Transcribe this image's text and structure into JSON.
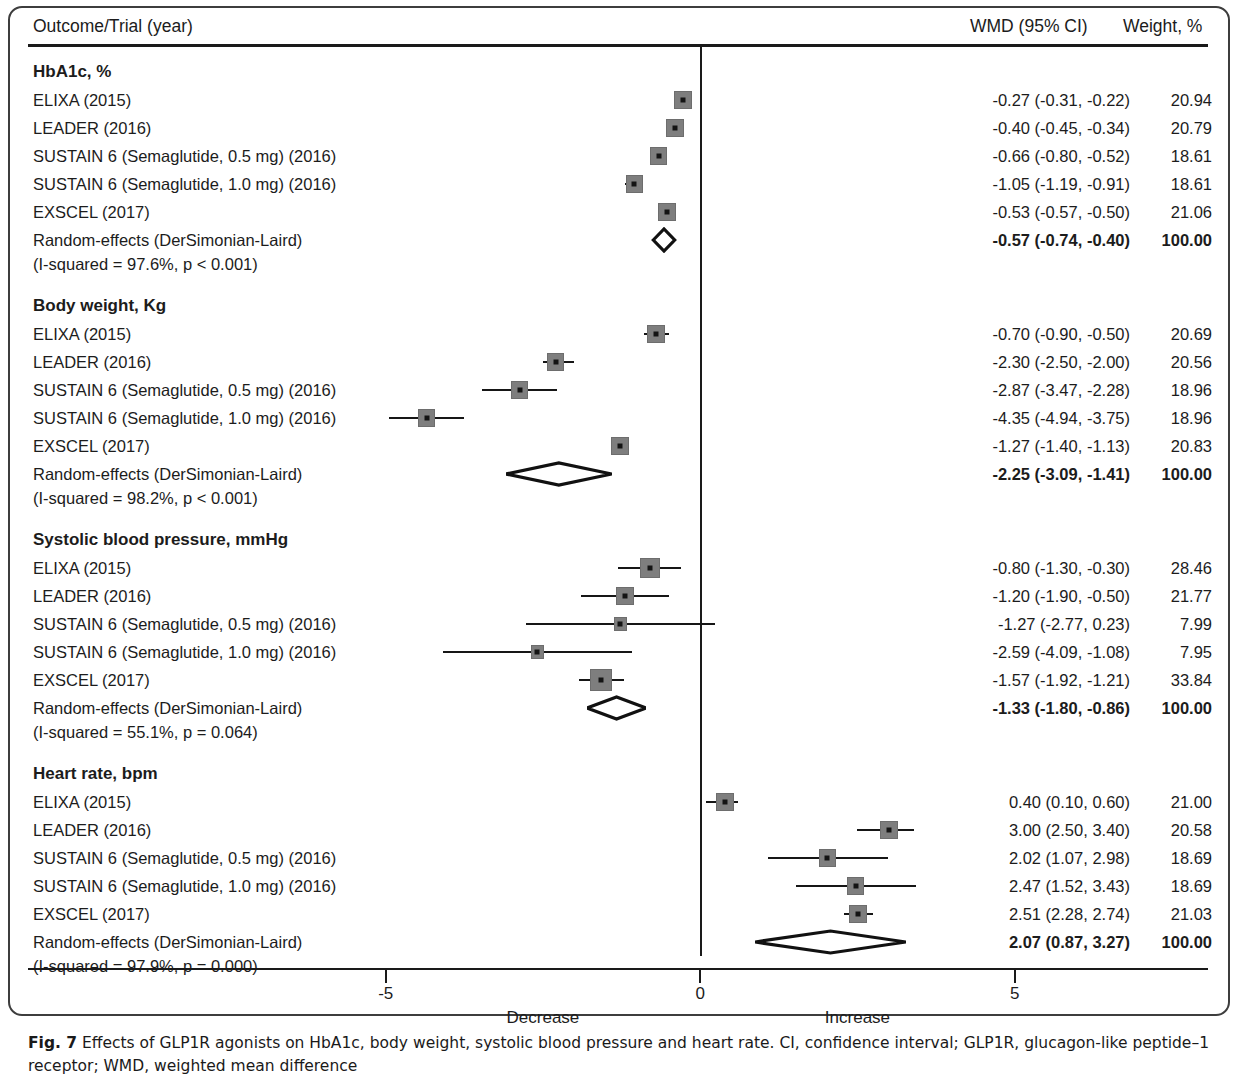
{
  "figure": {
    "caption_prefix": "Fig. 7",
    "caption_text": " Effects of GLP1R agonists on HbA1c, body weight, systolic blood pressure and heart rate. CI, confidence interval; GLP1R, glucagon-like peptide–1 receptor; WMD, weighted mean difference"
  },
  "header": {
    "outcome": "Outcome/Trial (year)",
    "wmd": "WMD (95% CI)",
    "weight": "Weight, %"
  },
  "axis": {
    "ticks": [
      {
        "value": -5,
        "label": "-5"
      },
      {
        "value": 0,
        "label": "0"
      },
      {
        "value": 5,
        "label": "5"
      }
    ],
    "left_direction_label": "Decrease",
    "right_direction_label": "Increase",
    "xmin": -5.95,
    "xmax": 5.95,
    "zero_reference": 0
  },
  "chart_data": {
    "type": "forest",
    "title": "Effects of GLP1R agonists on HbA1c, body weight, systolic blood pressure and heart rate",
    "xlabel": "",
    "ylabel": "",
    "effect_measure": "WMD (95% CI)",
    "xlim": [
      -5.95,
      5.95
    ],
    "xticks": [
      -5,
      0,
      5
    ],
    "grid": false,
    "legend": "none",
    "null_line": 0,
    "groups": [
      {
        "title": "HbA1c, %",
        "heterogeneity": "(I-squared = 97.6%, p < 0.001)",
        "pooled_label": "Random-effects (DerSimonian-Laird)",
        "pooled": {
          "est": -0.57,
          "lo": -0.74,
          "hi": -0.4,
          "text": "-0.57 (-0.74, -0.40)",
          "weight": "100.00"
        },
        "studies": [
          {
            "label": "ELIXA (2015)",
            "est": -0.27,
            "lo": -0.31,
            "hi": -0.22,
            "text": "-0.27 (-0.31, -0.22)",
            "weight": "20.94",
            "weight_num": 20.94
          },
          {
            "label": "LEADER (2016)",
            "est": -0.4,
            "lo": -0.45,
            "hi": -0.34,
            "text": "-0.40 (-0.45, -0.34)",
            "weight": "20.79",
            "weight_num": 20.79
          },
          {
            "label": "SUSTAIN 6 (Semaglutide, 0.5 mg) (2016)",
            "est": -0.66,
            "lo": -0.8,
            "hi": -0.52,
            "text": "-0.66 (-0.80, -0.52)",
            "weight": "18.61",
            "weight_num": 18.61
          },
          {
            "label": "SUSTAIN 6 (Semaglutide, 1.0 mg) (2016)",
            "est": -1.05,
            "lo": -1.19,
            "hi": -0.91,
            "text": "-1.05 (-1.19, -0.91)",
            "weight": "18.61",
            "weight_num": 18.61
          },
          {
            "label": "EXSCEL (2017)",
            "est": -0.53,
            "lo": -0.57,
            "hi": -0.5,
            "text": "-0.53 (-0.57, -0.50)",
            "weight": "21.06",
            "weight_num": 21.06
          }
        ]
      },
      {
        "title": "Body weight, Kg",
        "heterogeneity": "(I-squared = 98.2%, p < 0.001)",
        "pooled_label": "Random-effects (DerSimonian-Laird)",
        "pooled": {
          "est": -2.25,
          "lo": -3.09,
          "hi": -1.41,
          "text": "-2.25 (-3.09, -1.41)",
          "weight": "100.00"
        },
        "studies": [
          {
            "label": "ELIXA (2015)",
            "est": -0.7,
            "lo": -0.9,
            "hi": -0.5,
            "text": "-0.70 (-0.90, -0.50)",
            "weight": "20.69",
            "weight_num": 20.69
          },
          {
            "label": "LEADER (2016)",
            "est": -2.3,
            "lo": -2.5,
            "hi": -2.0,
            "text": "-2.30 (-2.50, -2.00)",
            "weight": "20.56",
            "weight_num": 20.56
          },
          {
            "label": "SUSTAIN 6 (Semaglutide, 0.5 mg) (2016)",
            "est": -2.87,
            "lo": -3.47,
            "hi": -2.28,
            "text": "-2.87 (-3.47, -2.28)",
            "weight": "18.96",
            "weight_num": 18.96
          },
          {
            "label": "SUSTAIN 6 (Semaglutide, 1.0 mg) (2016)",
            "est": -4.35,
            "lo": -4.94,
            "hi": -3.75,
            "text": "-4.35 (-4.94, -3.75)",
            "weight": "18.96",
            "weight_num": 18.96
          },
          {
            "label": "EXSCEL (2017)",
            "est": -1.27,
            "lo": -1.4,
            "hi": -1.13,
            "text": "-1.27 (-1.40, -1.13)",
            "weight": "20.83",
            "weight_num": 20.83
          }
        ]
      },
      {
        "title": "Systolic blood pressure, mmHg",
        "heterogeneity": "(I-squared = 55.1%, p = 0.064)",
        "pooled_label": "Random-effects (DerSimonian-Laird)",
        "pooled": {
          "est": -1.33,
          "lo": -1.8,
          "hi": -0.86,
          "text": "-1.33 (-1.80, -0.86)",
          "weight": "100.00"
        },
        "studies": [
          {
            "label": "ELIXA (2015)",
            "est": -0.8,
            "lo": -1.3,
            "hi": -0.3,
            "text": "-0.80 (-1.30, -0.30)",
            "weight": "28.46",
            "weight_num": 28.46
          },
          {
            "label": "LEADER (2016)",
            "est": -1.2,
            "lo": -1.9,
            "hi": -0.5,
            "text": "-1.20 (-1.90, -0.50)",
            "weight": "21.77",
            "weight_num": 21.77
          },
          {
            "label": "SUSTAIN 6 (Semaglutide, 0.5 mg) (2016)",
            "est": -1.27,
            "lo": -2.77,
            "hi": 0.23,
            "text": "-1.27 (-2.77, 0.23)",
            "weight": "7.99",
            "weight_num": 7.99
          },
          {
            "label": "SUSTAIN 6 (Semaglutide, 1.0 mg) (2016)",
            "est": -2.59,
            "lo": -4.09,
            "hi": -1.08,
            "text": "-2.59 (-4.09, -1.08)",
            "weight": "7.95",
            "weight_num": 7.95
          },
          {
            "label": "EXSCEL (2017)",
            "est": -1.57,
            "lo": -1.92,
            "hi": -1.21,
            "text": "-1.57 (-1.92, -1.21)",
            "weight": "33.84",
            "weight_num": 33.84
          }
        ]
      },
      {
        "title": "Heart rate, bpm",
        "heterogeneity": "(I-squared = 97.9%, p = 0.000)",
        "pooled_label": "Random-effects (DerSimonian-Laird)",
        "pooled": {
          "est": 2.07,
          "lo": 0.87,
          "hi": 3.27,
          "text": "2.07 (0.87, 3.27)",
          "weight": "100.00"
        },
        "studies": [
          {
            "label": "ELIXA (2015)",
            "est": 0.4,
            "lo": 0.1,
            "hi": 0.6,
            "text": "0.40 (0.10, 0.60)",
            "weight": "21.00",
            "weight_num": 21.0
          },
          {
            "label": "LEADER (2016)",
            "est": 3.0,
            "lo": 2.5,
            "hi": 3.4,
            "text": "3.00 (2.50, 3.40)",
            "weight": "20.58",
            "weight_num": 20.58
          },
          {
            "label": "SUSTAIN 6 (Semaglutide, 0.5 mg) (2016)",
            "est": 2.02,
            "lo": 1.07,
            "hi": 2.98,
            "text": "2.02 (1.07, 2.98)",
            "weight": "18.69",
            "weight_num": 18.69
          },
          {
            "label": "SUSTAIN 6 (Semaglutide, 1.0 mg) (2016)",
            "est": 2.47,
            "lo": 1.52,
            "hi": 3.43,
            "text": "2.47 (1.52, 3.43)",
            "weight": "18.69",
            "weight_num": 18.69
          },
          {
            "label": "EXSCEL (2017)",
            "est": 2.51,
            "lo": 2.28,
            "hi": 2.74,
            "text": "2.51 (2.28, 2.74)",
            "weight": "21.03",
            "weight_num": 21.03
          }
        ]
      }
    ]
  }
}
